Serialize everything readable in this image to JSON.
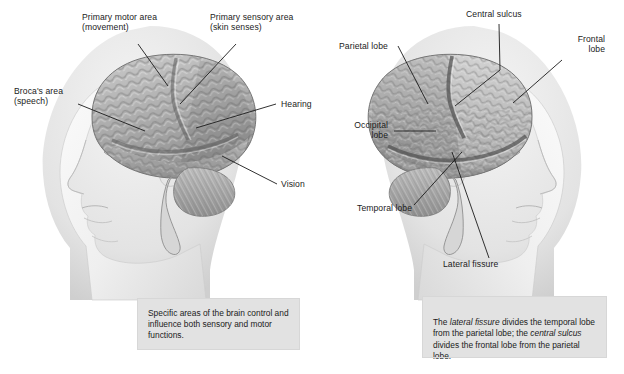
{
  "figure": {
    "background_color": "#ffffff",
    "label_color": "#1b1b1b",
    "caption_fill": "#e2e2e2"
  },
  "left_diagram": {
    "name": "functional-areas-of-the-brain",
    "labels": [
      {
        "id": "primary-motor-area",
        "text": "Primary motor area\n(movement)"
      },
      {
        "id": "primary-sensory-area",
        "text": "Primary sensory area\n(skin senses)"
      },
      {
        "id": "brocas-area",
        "text": "Broca's area\n(speech)"
      },
      {
        "id": "hearing",
        "text": "Hearing"
      },
      {
        "id": "vision",
        "text": "Vision"
      }
    ],
    "caption": "Specific areas of the brain control and influence both sensory and motor functions."
  },
  "right_diagram": {
    "name": "lobes-of-the-brain",
    "labels": [
      {
        "id": "central-sulcus",
        "text": "Central sulcus"
      },
      {
        "id": "parietal-lobe",
        "text": "Parietal lobe"
      },
      {
        "id": "frontal-lobe",
        "text": "Frontal\nlobe"
      },
      {
        "id": "occipital-lobe",
        "text": "Occipital\nlobe"
      },
      {
        "id": "temporal-lobe",
        "text": "Temporal lobe"
      },
      {
        "id": "lateral-fissure",
        "text": "Lateral fissure"
      }
    ],
    "caption": {
      "part1": "The ",
      "em1": "lateral fissure",
      "part2": " divides the temporal lobe from the parietal lobe; the ",
      "em2": "central sulcus",
      "part3": " divides the frontal lobe from the parietal lobe."
    }
  }
}
